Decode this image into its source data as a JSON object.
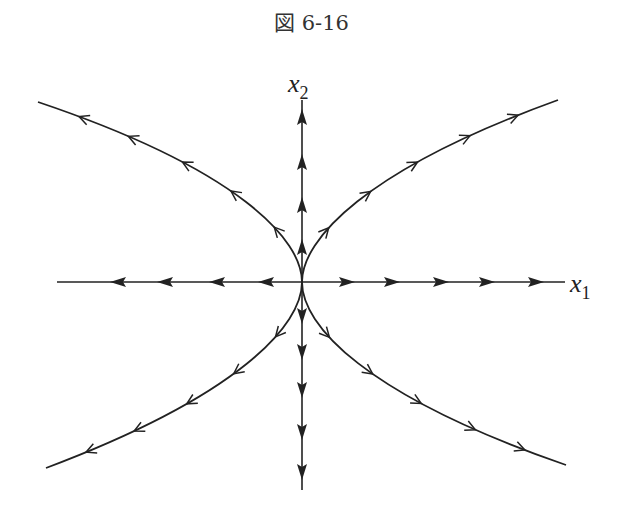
{
  "figure": {
    "title": "図 6-16",
    "type": "phase-portrait",
    "origin": [
      302,
      282
    ],
    "axes": {
      "x1": {
        "label": "x",
        "subscript": "1",
        "from": [
          57,
          282
        ],
        "to": [
          565,
          282
        ],
        "label_pos": [
          570,
          292
        ]
      },
      "x2": {
        "label": "x",
        "subscript": "2",
        "from": [
          302,
          490
        ],
        "to": [
          302,
          100
        ],
        "label_pos": [
          288,
          92
        ]
      }
    },
    "axis_arrows": {
      "x1_negative": {
        "direction": "left",
        "positions": [
          118,
          165,
          217,
          266
        ]
      },
      "x1_positive": {
        "direction": "right",
        "positions": [
          347,
          392,
          441,
          487,
          536
        ]
      },
      "x2_positive": {
        "direction": "up",
        "positions": [
          117,
          162,
          205,
          247
        ]
      },
      "x2_negative": {
        "direction": "down",
        "positions": [
          316,
          352,
          390,
          432,
          472
        ]
      }
    },
    "trajectories": [
      {
        "name": "upper-left",
        "direction": "outward",
        "path": "M302,282 C302,240 240,170 38,102",
        "arrow_t": [
          0.18,
          0.35,
          0.52,
          0.7,
          0.86
        ]
      },
      {
        "name": "upper-right",
        "direction": "outward",
        "path": "M302,282 C302,240 364,170 558,100",
        "arrow_t": [
          0.18,
          0.35,
          0.52,
          0.7,
          0.86
        ]
      },
      {
        "name": "lower-left",
        "direction": "outward",
        "path": "M302,282 C302,325 240,395 46,468",
        "arrow_t": [
          0.18,
          0.35,
          0.52,
          0.7,
          0.86
        ]
      },
      {
        "name": "lower-right",
        "direction": "outward",
        "path": "M302,282 C302,325 364,395 566,465",
        "arrow_t": [
          0.18,
          0.35,
          0.52,
          0.7,
          0.86
        ]
      }
    ],
    "colors": {
      "stroke": "#222222",
      "background": "#ffffff"
    }
  }
}
